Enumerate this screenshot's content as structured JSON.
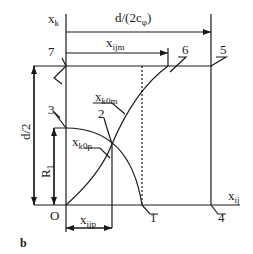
{
  "diagram": {
    "panel_label": "b",
    "axes": {
      "vertical": "x",
      "vertical_sub": "k",
      "horizontal": "x",
      "horizontal_sub": "ij",
      "origin": "O"
    },
    "dimensions": {
      "top_width": "d/(2c",
      "top_width_sub": "φ",
      "top_width_close": ")",
      "ijm": "x",
      "ijm_sub": "ijm",
      "ijp": "x",
      "ijp_sub": "ijp",
      "height": "d/2",
      "radius": "R",
      "radius_sub": "1"
    },
    "curves": {
      "k0m": "x",
      "k0m_sub": "k0m",
      "k0p": "x",
      "k0p_sub": "k0p"
    },
    "points": [
      "1",
      "2",
      "3",
      "4",
      "5",
      "6",
      "7"
    ]
  }
}
